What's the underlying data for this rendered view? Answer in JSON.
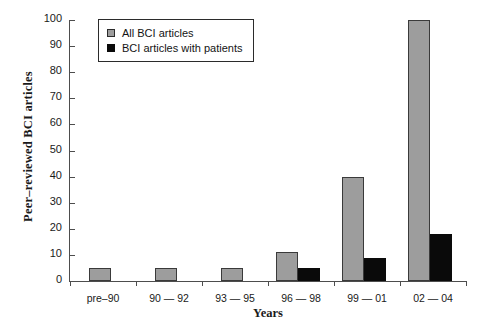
{
  "chart_data": {
    "type": "bar",
    "title": "",
    "xlabel": "Years",
    "ylabel": "Peer–reviewed BCI articles",
    "categories": [
      "pre–90",
      "90 — 92",
      "93 — 95",
      "96 — 98",
      "99 — 01",
      "02 — 04"
    ],
    "series": [
      {
        "name": "All BCI articles",
        "color": "#9d9d9d",
        "values": [
          5,
          5,
          5,
          11,
          40,
          100
        ]
      },
      {
        "name": "BCI articles with patients",
        "color": "#0a0a0a",
        "values": [
          0,
          0,
          0,
          5,
          9,
          18
        ]
      }
    ],
    "ylim": [
      0,
      100
    ],
    "yticks": [
      0,
      10,
      20,
      30,
      40,
      50,
      60,
      70,
      80,
      90,
      100
    ],
    "ytick_labels": [
      "0",
      "10",
      "20",
      "30",
      "40",
      "50",
      "60",
      "70",
      "80",
      "90",
      "100"
    ],
    "grid": false,
    "legend_position": "top-left-inside"
  },
  "legend": {
    "entries": [
      {
        "label": "All BCI articles",
        "swatch": "gray-square-marker"
      },
      {
        "label": "BCI articles with patients",
        "swatch": "black-square-marker"
      }
    ]
  }
}
